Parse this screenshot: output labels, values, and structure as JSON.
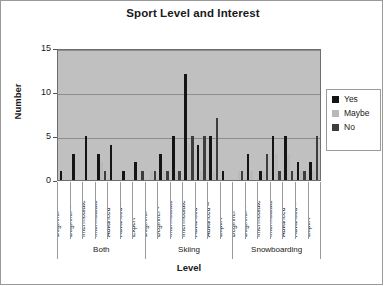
{
  "chart_data": {
    "type": "bar",
    "title": "Sport Level and Interest",
    "xlabel": "Level",
    "ylabel": "Number",
    "ylim": [
      0,
      15
    ],
    "yticks": [
      0,
      5,
      10,
      15
    ],
    "grid": true,
    "legend_position": "right",
    "groups": [
      "Both",
      "Skiing",
      "Snowboarding"
    ],
    "categories": [
      "Beginner",
      "Beginner -",
      "Intermediate",
      "Intermediate",
      "Advanced",
      "Advanced –",
      "Expert"
    ],
    "series": [
      {
        "name": "Yes",
        "color": "#141414",
        "values_by_group": {
          "Both": [
            1,
            3,
            5,
            3,
            4,
            1,
            2
          ],
          "Skiing": [
            0,
            3,
            5,
            12,
            4,
            5,
            1
          ],
          "Snowboarding": [
            0,
            3,
            1,
            5,
            5,
            2,
            2
          ]
        }
      },
      {
        "name": "Maybe",
        "color": "#b9b9b9",
        "values_by_group": {
          "Both": [
            0,
            0,
            0,
            2,
            0,
            0,
            0
          ],
          "Skiing": [
            1,
            1,
            1,
            4,
            1,
            1,
            0
          ],
          "Snowboarding": [
            1,
            1,
            1,
            3,
            3,
            1,
            1
          ]
        }
      },
      {
        "name": "No",
        "color": "#3d3d3d",
        "values_by_group": {
          "Both": [
            0,
            0,
            0,
            1,
            0,
            0,
            1
          ],
          "Skiing": [
            1,
            1,
            1,
            5,
            5,
            7,
            0
          ],
          "Snowboarding": [
            1,
            0,
            3,
            1,
            1,
            1,
            5
          ]
        }
      }
    ]
  },
  "legend": {
    "items": [
      {
        "label": "Yes",
        "color": "#141414"
      },
      {
        "label": "Maybe",
        "color": "#b9b9b9"
      },
      {
        "label": "No",
        "color": "#3d3d3d"
      }
    ]
  }
}
